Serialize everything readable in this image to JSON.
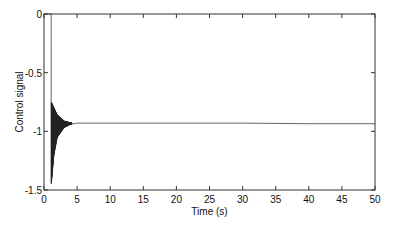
{
  "chart_data": {
    "type": "line",
    "title": "",
    "xlabel": "Time (s)",
    "ylabel": "Control signal",
    "xlim": [
      0,
      50
    ],
    "ylim": [
      -1.5,
      0
    ],
    "xticks": [
      0,
      5,
      10,
      15,
      20,
      25,
      30,
      35,
      40,
      45,
      50
    ],
    "yticks": [
      0,
      -0.5,
      -1,
      -1.5
    ],
    "xtick_labels": [
      "0",
      "5",
      "10",
      "15",
      "20",
      "25",
      "30",
      "35",
      "40",
      "45",
      "50"
    ],
    "ytick_labels": [
      "0",
      "-0.5",
      "-1",
      "-1.5"
    ],
    "grid": false,
    "legend": null,
    "series": [
      {
        "name": "Control signal",
        "color": "#222222",
        "description": "Zero until ~1.1 s, then sharp drop with decaying high-frequency oscillation (envelope approx -0.75 to -1.45) settling by ~4 s to a steady value of about -0.93 through 50 s",
        "x": [
          0,
          1.0,
          1.1,
          1.2,
          1.4,
          1.6,
          2.0,
          2.5,
          3.0,
          3.5,
          4.0,
          5.0,
          10,
          20,
          30,
          40,
          50
        ],
        "y": [
          0,
          0,
          -1.45,
          -0.75,
          -1.2,
          -0.78,
          -1.1,
          -0.84,
          -1.0,
          -0.9,
          -0.94,
          -0.93,
          -0.93,
          -0.93,
          -0.93,
          -0.935,
          -0.935
        ],
        "envelope_upper": [
          [
            1.1,
            -0.75
          ],
          [
            1.5,
            -0.8
          ],
          [
            2.0,
            -0.86
          ],
          [
            3.0,
            -0.91
          ],
          [
            4.0,
            -0.925
          ]
        ],
        "envelope_lower": [
          [
            1.1,
            -1.45
          ],
          [
            1.5,
            -1.2
          ],
          [
            2.0,
            -1.05
          ],
          [
            3.0,
            -0.97
          ],
          [
            4.0,
            -0.94
          ]
        ],
        "steady_state": -0.93
      }
    ]
  }
}
